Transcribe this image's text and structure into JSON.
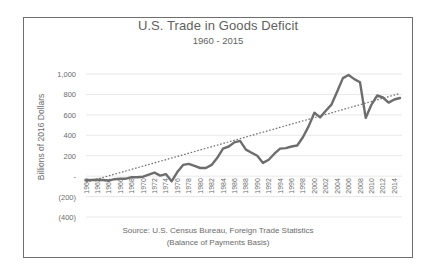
{
  "chart_data": {
    "type": "line",
    "title": "U.S. Trade in Goods Deficit",
    "subtitle": "1960 - 2015",
    "xlabel": "",
    "ylabel": "Billions of 2016 Dollars",
    "ylim": [
      -400,
      1000
    ],
    "yticks": [
      1000,
      800,
      600,
      400,
      200,
      0,
      -200,
      -400
    ],
    "ytick_labels": [
      "1,000",
      "800",
      "600",
      "400",
      "200",
      "-",
      "(200)",
      "(400)"
    ],
    "xtick_labels": [
      "1960",
      "1962",
      "1964",
      "1966",
      "1968",
      "1970",
      "1972",
      "1974",
      "1976",
      "1978",
      "1980",
      "1982",
      "1984",
      "1986",
      "1988",
      "1990",
      "1992",
      "1994",
      "1996",
      "1998",
      "2000",
      "2002",
      "2004",
      "2006",
      "2008",
      "2010",
      "2012",
      "2014"
    ],
    "grid": true,
    "legend": "none",
    "x": [
      1960,
      1961,
      1962,
      1963,
      1964,
      1965,
      1966,
      1967,
      1968,
      1969,
      1970,
      1971,
      1972,
      1973,
      1974,
      1975,
      1976,
      1977,
      1978,
      1979,
      1980,
      1981,
      1982,
      1983,
      1984,
      1985,
      1986,
      1987,
      1988,
      1989,
      1990,
      1991,
      1992,
      1993,
      1994,
      1995,
      1996,
      1997,
      1998,
      1999,
      2000,
      2001,
      2002,
      2003,
      2004,
      2005,
      2006,
      2007,
      2008,
      2009,
      2010,
      2011,
      2012,
      2013,
      2014,
      2015
    ],
    "series": [
      {
        "name": "Trade in Goods Deficit",
        "style": "solid",
        "color": "#6d6d6d",
        "values": [
          -40,
          -38,
          -35,
          -38,
          -45,
          -30,
          -25,
          -25,
          -10,
          -10,
          -5,
          15,
          35,
          5,
          20,
          -50,
          40,
          110,
          120,
          100,
          80,
          80,
          110,
          180,
          270,
          290,
          330,
          345,
          260,
          230,
          200,
          130,
          160,
          220,
          270,
          275,
          290,
          300,
          380,
          490,
          620,
          575,
          640,
          700,
          830,
          960,
          990,
          950,
          920,
          570,
          700,
          790,
          770,
          720,
          750,
          765
        ]
      },
      {
        "name": "Linear trend",
        "style": "dotted",
        "color": "#6d6d6d",
        "values_endpoints": {
          "1960": -60,
          "2015": 810
        }
      }
    ],
    "annotations": [
      "Source:  U.S. Census Bureau, Foreign Trade Statistics",
      "(Balance of Payments Basis)"
    ]
  },
  "colors": {
    "line": "#6d6d6d",
    "grid": "#e2e2e2",
    "frame": "#6e6e6e",
    "text": "#6b6b6b"
  }
}
